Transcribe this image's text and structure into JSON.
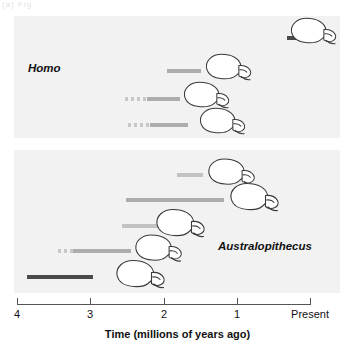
{
  "figure": {
    "corner_mark": "(a) Fig",
    "background_color": "#ffffff",
    "panel_color": "#f2f2f2"
  },
  "axis": {
    "title": "Time (millions of years ago)",
    "ticks": [
      {
        "label": "4",
        "value": 4,
        "x": 17
      },
      {
        "label": "3",
        "value": 3,
        "x": 90
      },
      {
        "label": "2",
        "value": 2,
        "x": 164
      },
      {
        "label": "1",
        "value": 1,
        "x": 237
      },
      {
        "label": "Present",
        "value": 0,
        "x": 310
      }
    ],
    "range": [
      4,
      0
    ],
    "direction": "oldest-left"
  },
  "panels": [
    {
      "id": "homo",
      "genus_label": "Homo",
      "label_x": 28,
      "label_y": 62,
      "top": 16,
      "height": 122
    },
    {
      "id": "australopithecus",
      "genus_label": "Australopithecus",
      "label_x": 218,
      "label_y": 240,
      "top": 150,
      "height": 143
    }
  ],
  "chart_data": {
    "type": "bar",
    "xlabel": "Time (millions of years ago)",
    "ylabel": "",
    "xlim": [
      4,
      0
    ],
    "grid": false,
    "legend": "none",
    "note": "Horizontal range bars; solid = confirmed range, dashed = uncertain/inferred range. x is in millions of years ago.",
    "categories": [
      "H. sapiens",
      "H. erectus",
      "H. rudolfensis",
      "H. habilis",
      "A. robustus",
      "A. boisei",
      "A. aethiopicus",
      "A. africanus",
      "A. afarensis"
    ],
    "series": [
      {
        "name": "Solid (known range)",
        "bars": [
          {
            "taxon": "H. sapiens",
            "start_mya": 0.32,
            "end_mya": 0.0,
            "shade": "solid-dark"
          },
          {
            "taxon": "H. erectus",
            "start_mya": 1.85,
            "end_mya": 1.38,
            "shade": "solid-mid"
          },
          {
            "taxon": "H. rudolfensis",
            "start_mya": 2.15,
            "end_mya": 1.7,
            "shade": "solid-mid"
          },
          {
            "taxon": "H. habilis",
            "start_mya": 2.1,
            "end_mya": 1.58,
            "shade": "solid-mid"
          },
          {
            "taxon": "A. robustus",
            "start_mya": 1.85,
            "end_mya": 1.5,
            "shade": "solid-light"
          },
          {
            "taxon": "A. boisei",
            "start_mya": 2.65,
            "end_mya": 1.32,
            "shade": "solid-mid"
          },
          {
            "taxon": "A. aethiopicus",
            "start_mya": 2.7,
            "end_mya": 2.2,
            "shade": "solid-light"
          },
          {
            "taxon": "A. africanus",
            "start_mya": 3.1,
            "end_mya": 2.3,
            "shade": "solid-mid"
          },
          {
            "taxon": "A. afarensis",
            "start_mya": 3.85,
            "end_mya": 2.95,
            "shade": "solid-dark"
          }
        ]
      },
      {
        "name": "Dashed (uncertain range)",
        "bars": [
          {
            "taxon": "H. rudolfensis",
            "start_mya": 2.45,
            "end_mya": 2.15
          },
          {
            "taxon": "H. habilis",
            "start_mya": 2.4,
            "end_mya": 2.1
          },
          {
            "taxon": "A. africanus",
            "start_mya": 3.3,
            "end_mya": 3.1
          }
        ]
      }
    ]
  },
  "taxa": [
    {
      "id": "h-sapiens",
      "name": "H. sapiens",
      "panel": "homo",
      "label_right": 263,
      "label_bottom": 34,
      "bar": {
        "left": 287,
        "width": 23,
        "top": 36,
        "shade": "solid-dark"
      },
      "dash": null,
      "skull": {
        "left": 288,
        "top": 16,
        "width": 52,
        "height": 30
      }
    },
    {
      "id": "h-erectus",
      "name": "H. erectus",
      "panel": "homo",
      "label_right": 204,
      "label_bottom": 67,
      "bar": {
        "left": 167,
        "width": 34,
        "top": 69,
        "shade": "solid-mid"
      },
      "dash": null,
      "skull": {
        "left": 203,
        "top": 52,
        "width": 52,
        "height": 30
      }
    },
    {
      "id": "h-rudolfensis",
      "name": "H. rudolfensis",
      "panel": "homo",
      "label_right": 179,
      "label_bottom": 95,
      "bar": {
        "left": 147,
        "width": 33,
        "top": 97,
        "shade": "solid-mid"
      },
      "dash": {
        "left": 125,
        "width": 22,
        "top": 97
      },
      "skull": {
        "left": 181,
        "top": 80,
        "width": 52,
        "height": 30
      }
    },
    {
      "id": "h-habilis",
      "name": "H. habilis",
      "panel": "homo",
      "label_right": 196,
      "label_bottom": 121,
      "bar": {
        "left": 150,
        "width": 38,
        "top": 123,
        "shade": "solid-mid"
      },
      "dash": {
        "left": 128,
        "width": 22,
        "top": 123
      },
      "skull": {
        "left": 197,
        "top": 106,
        "width": 52,
        "height": 30
      }
    },
    {
      "id": "a-robustus",
      "name": "A. robustus",
      "panel": "australopithecus",
      "label_right": 205,
      "label_bottom": 171,
      "bar": {
        "left": 177,
        "width": 26,
        "top": 173,
        "shade": "solid-light"
      },
      "dash": null,
      "skull": {
        "left": 206,
        "top": 156,
        "width": 52,
        "height": 32
      }
    },
    {
      "id": "a-boisei",
      "name": "A. boisei",
      "panel": "australopithecus",
      "label_right": 227,
      "label_bottom": 196,
      "bar": {
        "left": 126,
        "width": 98,
        "top": 198,
        "shade": "solid-mid"
      },
      "dash": null,
      "skull": {
        "left": 228,
        "top": 181,
        "width": 54,
        "height": 32
      }
    },
    {
      "id": "a-aethiopicus",
      "name": "A. aethiopicus",
      "panel": "australopithecus",
      "label_right": 152,
      "label_bottom": 222,
      "bar": {
        "left": 122,
        "width": 37,
        "top": 224,
        "shade": "solid-light"
      },
      "dash": null,
      "skull": {
        "left": 154,
        "top": 207,
        "width": 54,
        "height": 32
      }
    },
    {
      "id": "a-africanus",
      "name": "A. africanus",
      "panel": "australopithecus",
      "label_right": 132,
      "label_bottom": 247,
      "bar": {
        "left": 73,
        "width": 58,
        "top": 249,
        "shade": "solid-mid"
      },
      "dash": {
        "left": 58,
        "width": 15,
        "top": 249
      },
      "skull": {
        "left": 133,
        "top": 232,
        "width": 52,
        "height": 32
      }
    },
    {
      "id": "a-afarensis",
      "name": "A. afarensis",
      "panel": "australopithecus",
      "label_right": 113,
      "label_bottom": 273,
      "bar": {
        "left": 27,
        "width": 66,
        "top": 275,
        "shade": "solid-dark"
      },
      "dash": null,
      "skull": {
        "left": 114,
        "top": 258,
        "width": 54,
        "height": 32
      }
    }
  ]
}
